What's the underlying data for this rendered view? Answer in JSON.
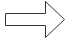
{
  "shape": {
    "type": "block-arrow",
    "direction": "right",
    "icon": "right-arrow-icon",
    "fill": "#ffffff",
    "stroke": "#333333"
  },
  "background": "#ffffff"
}
